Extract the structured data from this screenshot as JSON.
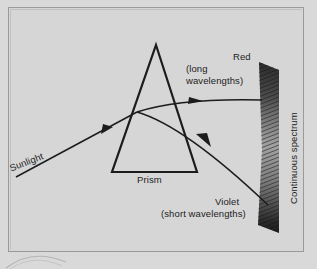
{
  "figure": {
    "background_color": "#d6d6d6",
    "ink_color": "#1c1c1c",
    "frame_color": "#9a9a9a"
  },
  "labels": {
    "sunlight": "Sunlight",
    "prism": "Prism",
    "red": "Red",
    "red_detail": "(long\nwavelengths)",
    "red_detail_line1": "(long",
    "red_detail_line2": "wavelengths)",
    "violet": "Violet",
    "violet_detail": "(short wavelengths)",
    "continuous_spectrum": "Continuous spectrum"
  },
  "diagram": {
    "prism": {
      "apex": [
        156,
        45
      ],
      "bottom_left": [
        112,
        172
      ],
      "bottom_right": [
        197,
        172
      ]
    },
    "rays": [
      {
        "name": "incident-sunlight-ray",
        "label": "Sunlight",
        "from": [
          16,
          177
        ],
        "to": [
          137,
          112
        ],
        "arrowhead_at": [
          107,
          128
        ]
      },
      {
        "name": "red-refracted-ray",
        "label": "Red",
        "from": [
          137,
          112
        ],
        "to": [
          262,
          100
        ],
        "arrowhead_at": [
          199,
          101
        ]
      },
      {
        "name": "violet-refracted-ray",
        "label": "Violet",
        "from": [
          137,
          112
        ],
        "to": [
          268,
          205
        ],
        "arrowhead_at": [
          207,
          144
        ]
      }
    ],
    "spectrum_band": {
      "name": "continuous-spectrum-band",
      "x_left": 258,
      "x_right": 279,
      "y_top": 62,
      "y_bottom": 233,
      "texture": "diagonal-hatching"
    }
  }
}
